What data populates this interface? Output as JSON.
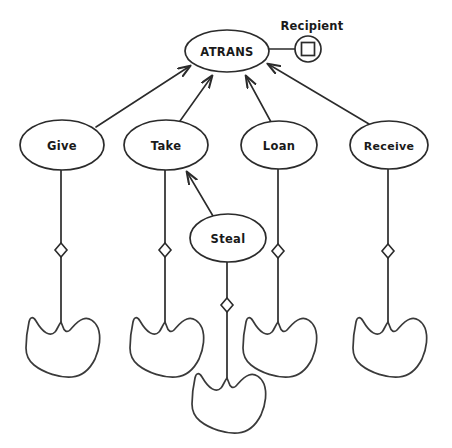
{
  "diagram": {
    "colors": {
      "stroke": "#2b2b2b",
      "hand_stroke": "#3a3a3a",
      "background": "#ffffff",
      "node_fill": "#ffffff"
    },
    "root": {
      "label": "ATRANS",
      "cx": 227,
      "cy": 51,
      "rx": 42,
      "ry": 21
    },
    "role": {
      "label": "Recipient",
      "label_x": 312,
      "label_y": 26,
      "circle_cx": 308,
      "circle_cy": 49,
      "circle_r": 13,
      "square_size": 13,
      "connector_from_x": 269,
      "connector_to_x": 295,
      "connector_y": 49
    },
    "verbs": [
      {
        "label": "Give",
        "cx": 62,
        "cy": 145,
        "rx": 42,
        "ry": 25,
        "stem_top": 170,
        "diamond_y": 250,
        "stem_bottom": 322,
        "hand_cx": 60,
        "hand_cy": 345
      },
      {
        "label": "Take",
        "cx": 166,
        "cy": 145,
        "rx": 42,
        "ry": 25,
        "stem_top": 170,
        "diamond_y": 250,
        "stem_bottom": 322,
        "hand_cx": 164,
        "hand_cy": 345
      },
      {
        "label": "Loan",
        "cx": 279,
        "cy": 145,
        "rx": 38,
        "ry": 24,
        "stem_top": 169,
        "diamond_y": 251,
        "stem_bottom": 322,
        "hand_cx": 277,
        "hand_cy": 345
      },
      {
        "label": "Receive",
        "cx": 389,
        "cy": 145,
        "rx": 39,
        "ry": 24,
        "stem_top": 169,
        "diamond_y": 251,
        "stem_bottom": 322,
        "hand_cx": 387,
        "hand_cy": 345
      }
    ],
    "steal": {
      "label": "Steal",
      "cx": 228,
      "cy": 238,
      "rx": 38,
      "ry": 24,
      "stem_top": 262,
      "diamond_y": 305,
      "stem_bottom": 378,
      "hand_cx": 226,
      "hand_cy": 401
    },
    "edges": [
      {
        "name": "give-to-atrans",
        "from": "Give",
        "to": "ATRANS",
        "x1": 96,
        "y1": 127,
        "x2": 190,
        "y2": 66,
        "arrow": true
      },
      {
        "name": "take-to-atrans",
        "from": "Take",
        "to": "ATRANS",
        "x1": 180,
        "y1": 121,
        "x2": 212,
        "y2": 74,
        "arrow": true
      },
      {
        "name": "loan-to-atrans",
        "from": "Loan",
        "to": "ATRANS",
        "x1": 271,
        "y1": 122,
        "x2": 245,
        "y2": 74,
        "arrow": true
      },
      {
        "name": "receive-to-atrans",
        "from": "Receive",
        "to": "ATRANS",
        "x1": 369,
        "y1": 124,
        "x2": 267,
        "y2": 64,
        "arrow": true
      },
      {
        "name": "steal-to-take",
        "from": "Steal",
        "to": "Take",
        "x1": 213,
        "y1": 216,
        "x2": 186,
        "y2": 170,
        "arrow": true
      }
    ],
    "diamond_half_width": 6,
    "diamond_half_height": 7
  }
}
